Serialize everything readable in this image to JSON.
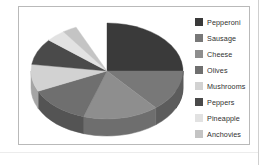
{
  "chart_frame": {
    "border_color": "#b9b9b9",
    "background": "#ffffff"
  },
  "legend": {
    "position": "right",
    "items": [
      {
        "label": "Pepperoni",
        "swatch_color": "#3a3a3a"
      },
      {
        "label": "Sausage",
        "swatch_color": "#787878"
      },
      {
        "label": "Cheese",
        "swatch_color": "#8e8e8e"
      },
      {
        "label": "Olives",
        "swatch_color": "#6f6f6f"
      },
      {
        "label": "Mushrooms",
        "swatch_color": "#d2d2d2"
      },
      {
        "label": "Peppers",
        "swatch_color": "#4a4a4a"
      },
      {
        "label": "Pineapple",
        "swatch_color": "#e2e2e2"
      },
      {
        "label": "Anchovies",
        "swatch_color": "#c4c4c4"
      }
    ]
  },
  "chart_data": {
    "type": "pie",
    "title": "",
    "subtitle": "",
    "xlabel": "",
    "ylabel": "",
    "three_d": true,
    "grid": false,
    "legend_position": "right",
    "categories": [
      "Pepperoni",
      "Sausage",
      "Cheese",
      "Olives",
      "Mushrooms",
      "Peppers",
      "Pineapple",
      "Anchovies"
    ],
    "values": [
      32,
      14,
      16,
      13,
      9,
      9,
      4,
      3
    ],
    "colors": [
      "#3a3a3a",
      "#787878",
      "#8e8e8e",
      "#6f6f6f",
      "#d2d2d2",
      "#4a4a4a",
      "#e2e2e2",
      "#c4c4c4"
    ],
    "side_colors": [
      "#2b2b2b",
      "#5c5c5c",
      "#6e6e6e",
      "#545454",
      "#a5a5a5",
      "#373737",
      "#b4b4b4",
      "#9a9a9a"
    ],
    "slices": [
      {
        "label": "Pepperoni",
        "value": 32,
        "start_deg": 270,
        "end_deg": 385,
        "color": "#3a3a3a"
      },
      {
        "label": "Sausage",
        "value": 14,
        "start_deg": 0,
        "end_deg": 50,
        "color": "#787878"
      },
      {
        "label": "Cheese",
        "value": 16,
        "start_deg": 50,
        "end_deg": 108,
        "color": "#8e8e8e"
      },
      {
        "label": "Olives",
        "value": 13,
        "start_deg": 108,
        "end_deg": 155,
        "color": "#6f6f6f"
      },
      {
        "label": "Mushrooms",
        "value": 9,
        "start_deg": 155,
        "end_deg": 188,
        "color": "#d2d2d2"
      },
      {
        "label": "Peppers",
        "value": 9,
        "start_deg": 188,
        "end_deg": 220,
        "color": "#4a4a4a"
      },
      {
        "label": "Pineapple",
        "value": 4,
        "start_deg": 220,
        "end_deg": 235,
        "color": "#e2e2e2"
      },
      {
        "label": "Anchovies",
        "value": 3,
        "start_deg": 235,
        "end_deg": 246,
        "color": "#c4c4c4"
      }
    ]
  }
}
